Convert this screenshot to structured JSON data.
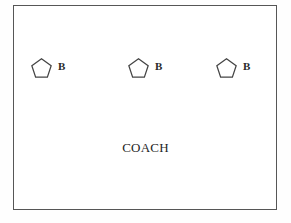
{
  "diagram": {
    "type": "sports-drill-diagram",
    "title": "",
    "court": {
      "border_color": "#565656",
      "fill_color": "#ffffff",
      "x": 13,
      "y": 5,
      "width": 264,
      "height": 205
    },
    "players": [
      {
        "label": "B",
        "icon": "pentagon-icon",
        "x": 31,
        "y": 58
      },
      {
        "label": "B",
        "icon": "pentagon-icon",
        "x": 128,
        "y": 58
      },
      {
        "label": "B",
        "icon": "pentagon-icon",
        "x": 216,
        "y": 58
      }
    ],
    "coach": {
      "label": "COACH",
      "y": 140
    },
    "colors": {
      "outline": "#444444",
      "text": "#1f1f1f",
      "background": "#ffffff"
    }
  }
}
